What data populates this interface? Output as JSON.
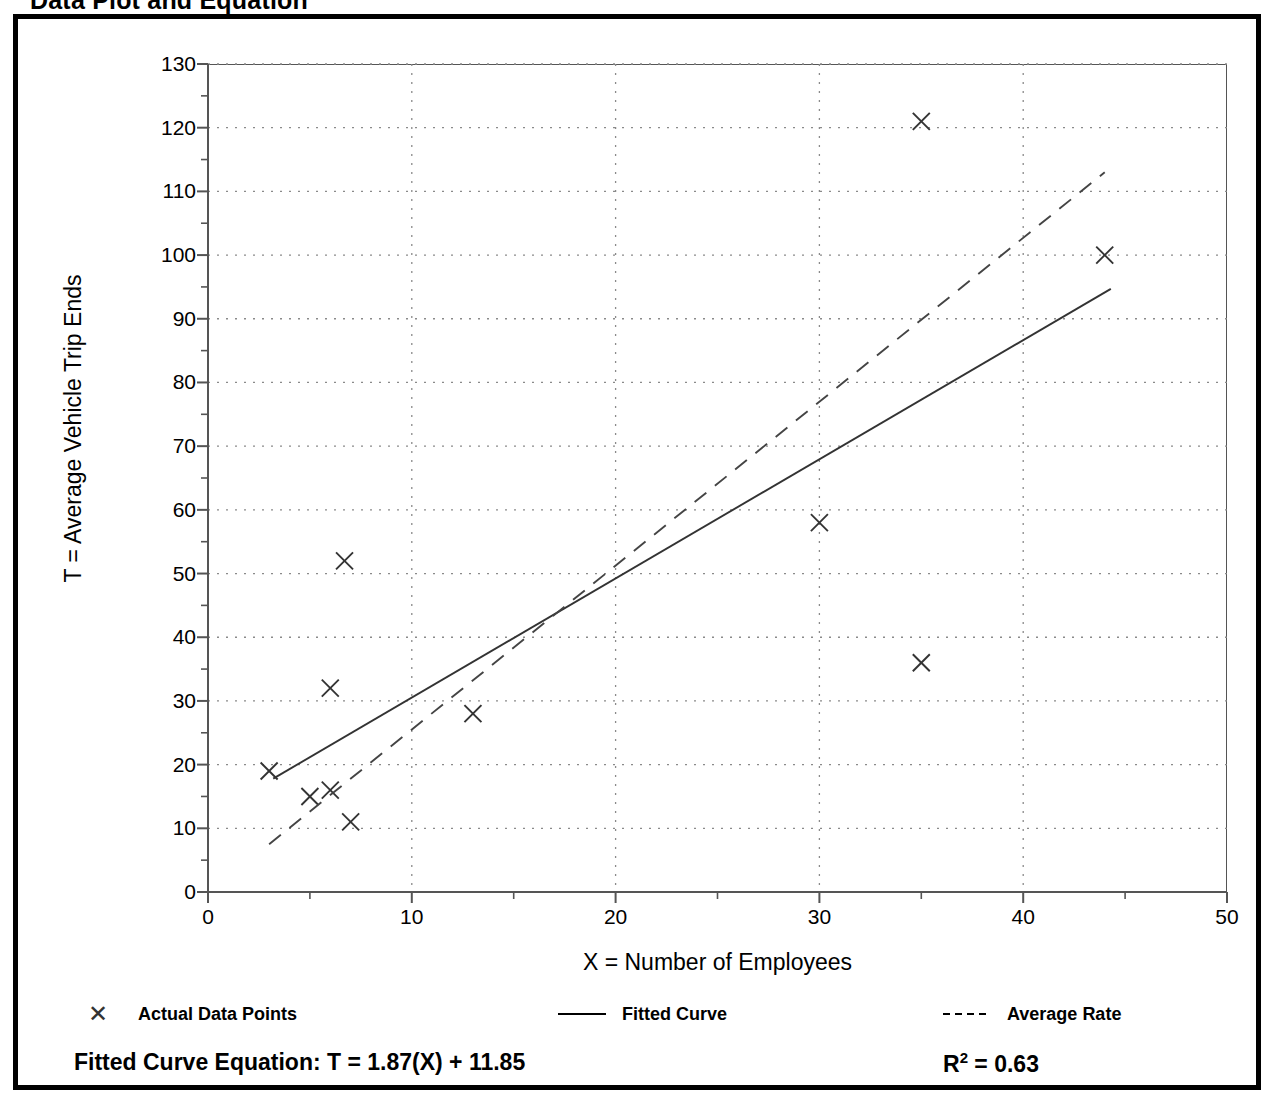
{
  "title": "Data Plot and Equation",
  "chart_data": {
    "type": "scatter",
    "title": "Data Plot and Equation",
    "xlabel": "X = Number of Employees",
    "ylabel": "T = Average Vehicle Trip Ends",
    "xlim": [
      0,
      50
    ],
    "ylim": [
      0,
      130
    ],
    "xticks": [
      0,
      10,
      20,
      30,
      40,
      50
    ],
    "yticks": [
      0,
      10,
      20,
      30,
      40,
      50,
      60,
      70,
      80,
      90,
      100,
      110,
      120,
      130
    ],
    "xtick_labels": [
      "0",
      "10",
      "20",
      "30",
      "40",
      "50"
    ],
    "ytick_labels": [
      "0",
      "10",
      "20",
      "30",
      "40",
      "50",
      "60",
      "70",
      "80",
      "90",
      "100",
      "110",
      "120",
      "130"
    ],
    "x_minor_tick_interval": 5,
    "y_minor_tick_interval": 5,
    "grid": true,
    "grid_style": "dotted",
    "legend_position": "below-axes",
    "series": [
      {
        "name": "Actual Data Points",
        "type": "scatter",
        "marker": "x",
        "points": [
          {
            "x": 3,
            "y": 19
          },
          {
            "x": 5,
            "y": 15
          },
          {
            "x": 6,
            "y": 16
          },
          {
            "x": 6,
            "y": 32
          },
          {
            "x": 6.7,
            "y": 52
          },
          {
            "x": 7,
            "y": 11
          },
          {
            "x": 13,
            "y": 28
          },
          {
            "x": 30,
            "y": 58
          },
          {
            "x": 35,
            "y": 36
          },
          {
            "x": 35,
            "y": 121
          },
          {
            "x": 44,
            "y": 100
          }
        ]
      },
      {
        "name": "Fitted Curve",
        "type": "line",
        "style": "solid",
        "equation": "T = 1.87(X) + 11.85",
        "slope": 1.87,
        "intercept": 11.85,
        "r_squared": 0.63,
        "x_start": 3.2,
        "x_end": 44.3,
        "y_start": 17.8,
        "y_end": 94.7
      },
      {
        "name": "Average Rate",
        "type": "line",
        "style": "dashed",
        "slope": 2.56,
        "intercept": 0,
        "x_start": 3.0,
        "x_end": 44.0,
        "y_start": 7.5,
        "y_end": 113.0
      }
    ]
  },
  "legend": {
    "items": [
      {
        "label": "Actual Data Points",
        "marker": "x",
        "left": 56
      },
      {
        "label": "Fitted Curve",
        "marker": "solid-line",
        "left": 540
      },
      {
        "label": "Average Rate",
        "marker": "dashed-line",
        "left": 925
      }
    ]
  },
  "footer": {
    "equation_prefix": "Fitted Curve Equation:",
    "equation": "T = 1.87(X) + 11.85",
    "equation_full": "Fitted Curve Equation:  T = 1.87(X) + 11.85",
    "r_squared_base": "R",
    "r_squared_exponent": "2",
    "r_squared_value": "= 0.63",
    "r_squared_full": "R2 = 0.63"
  },
  "colors": {
    "background": "#ffffff",
    "frame": "#000000",
    "axis": "#555555",
    "grid": "#8a8a8a",
    "marker": "#333333",
    "fitted_line": "#333333",
    "average_rate_line": "#444444",
    "text": "#000000"
  }
}
